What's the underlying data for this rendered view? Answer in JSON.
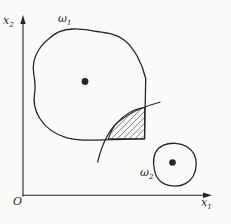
{
  "labels": {
    "y_axis": {
      "base": "x",
      "sub": "2"
    },
    "x_axis": {
      "base": "x",
      "sub": "1"
    },
    "origin": "O",
    "region1": {
      "base": "ω",
      "sub": "1"
    },
    "region2": {
      "base": "ω",
      "sub": "2"
    }
  },
  "colors": {
    "ink": "#262626",
    "paper": "#fafaf8",
    "hatch_line": "#3a3a3a"
  }
}
